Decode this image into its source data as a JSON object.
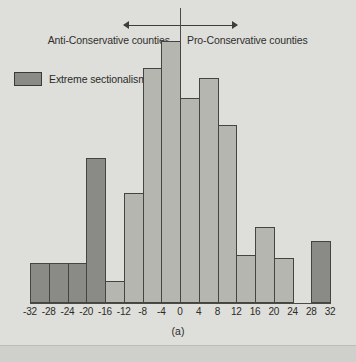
{
  "figure": {
    "caption": "(a)",
    "background_color": "#dededa"
  },
  "annotations": {
    "left_label": "Anti-Conservative counties",
    "right_label": "Pro-Conservative counties",
    "left_arrow_icon": "arrow-left-icon",
    "right_arrow_icon": "arrow-right-icon",
    "divider_icon": "vertical-rule-icon"
  },
  "legend": {
    "entries": [
      {
        "label": "Extreme sectionalism",
        "color": "#8a8a86"
      }
    ],
    "position": "upper-left-inside"
  },
  "colors": {
    "dark_bar": "#8a8a86",
    "light_bar": "#b6b6b0",
    "outline": "#45453f",
    "text": "#2b2b29"
  },
  "chart_data": {
    "type": "bar",
    "title": "",
    "subtitle": "",
    "xlabel": "",
    "ylabel": "",
    "caption": "(a)",
    "grid": false,
    "legend_position": "upper-left-inside",
    "xlim": [
      -32,
      32
    ],
    "ylim": [
      0,
      285
    ],
    "bin_width": 4,
    "tick_labels": [
      "-32",
      "-28",
      "-24",
      "-20",
      "-16",
      "-12",
      "-8",
      "-4",
      "0",
      "4",
      "8",
      "12",
      "16",
      "20",
      "24",
      "28",
      "32"
    ],
    "tick_values": [
      -32,
      -28,
      -24,
      -20,
      -16,
      -12,
      -8,
      -4,
      0,
      4,
      8,
      12,
      16,
      20,
      24,
      28,
      32
    ],
    "bins": [
      {
        "start": -32,
        "end": -28,
        "value": 40,
        "group": "Extreme sectionalism"
      },
      {
        "start": -28,
        "end": -24,
        "value": 40,
        "group": "Extreme sectionalism"
      },
      {
        "start": -24,
        "end": -20,
        "value": 40,
        "group": "Extreme sectionalism"
      },
      {
        "start": -20,
        "end": -16,
        "value": 145,
        "group": "Extreme sectionalism"
      },
      {
        "start": -16,
        "end": -12,
        "value": 22,
        "group": "Other"
      },
      {
        "start": -12,
        "end": -8,
        "value": 110,
        "group": "Other"
      },
      {
        "start": -8,
        "end": -4,
        "value": 235,
        "group": "Other"
      },
      {
        "start": -4,
        "end": 0,
        "value": 262,
        "group": "Other"
      },
      {
        "start": 0,
        "end": 4,
        "value": 205,
        "group": "Other"
      },
      {
        "start": 4,
        "end": 8,
        "value": 225,
        "group": "Other"
      },
      {
        "start": 8,
        "end": 12,
        "value": 178,
        "group": "Other"
      },
      {
        "start": 12,
        "end": 16,
        "value": 48,
        "group": "Other"
      },
      {
        "start": 16,
        "end": 20,
        "value": 76,
        "group": "Other"
      },
      {
        "start": 20,
        "end": 24,
        "value": 45,
        "group": "Other"
      },
      {
        "start": 24,
        "end": 28,
        "value": 0,
        "group": "Other"
      },
      {
        "start": 28,
        "end": 32,
        "value": 62,
        "group": "Extreme sectionalism"
      }
    ]
  }
}
